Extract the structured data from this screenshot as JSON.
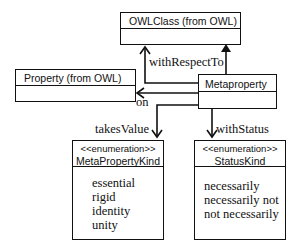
{
  "diagram": {
    "type": "UML class diagram",
    "classes": {
      "owlclass": {
        "name": "OWLClass (from OWL)"
      },
      "property": {
        "name": "Property (from OWL)"
      },
      "metaproperty": {
        "name": "Metaproperty"
      },
      "metapropertykind": {
        "stereotype": "<<enumeration>>",
        "name": "MetaPropertyKind",
        "literals": [
          "essential",
          "rigid",
          "identity",
          "unity"
        ]
      },
      "statuskind": {
        "stereotype": "<<enumeration>>",
        "name": "StatusKind",
        "literals": [
          "necessarily",
          "necessarily not",
          "not necessarily"
        ]
      }
    },
    "relationships": {
      "generalization": {
        "from": "Metaproperty",
        "to": "OWLClass (from OWL)"
      },
      "withRespectTo": {
        "label": "withRespectTo",
        "from": "Metaproperty",
        "to": "OWLClass (from OWL)"
      },
      "on": {
        "label": "on",
        "from": "Metaproperty",
        "to": "Property (from OWL)"
      },
      "takesValue": {
        "label": "takesValue",
        "from": "Metaproperty",
        "to": "MetaPropertyKind"
      },
      "withStatus": {
        "label": "withStatus",
        "from": "Metaproperty",
        "to": "StatusKind"
      }
    },
    "colors": {
      "line": "#111111",
      "background": "#ffffff"
    }
  }
}
